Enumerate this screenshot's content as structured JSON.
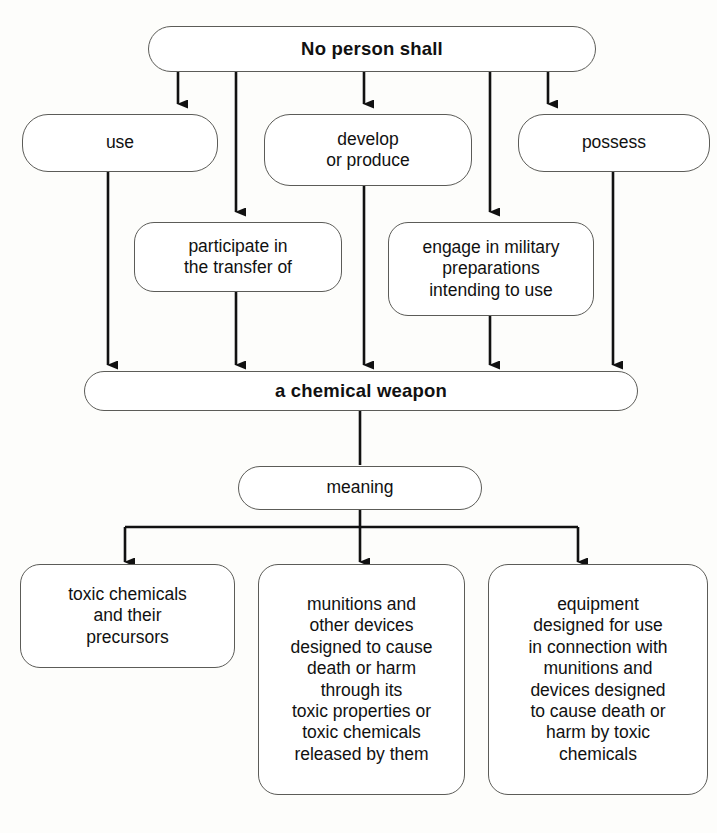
{
  "diagram": {
    "stroke_color": "#5c5c58",
    "arrow_color": "#111111",
    "background_color": "#fdfdfb",
    "text_color": "#111111"
  },
  "nodes": {
    "root": {
      "label": "No person shall"
    },
    "prohibitions": [
      {
        "id": "use",
        "label": "use"
      },
      {
        "id": "develop-or-produce",
        "label": "develop\nor produce"
      },
      {
        "id": "possess",
        "label": "possess"
      },
      {
        "id": "participate-in-transfer",
        "label": "participate in\nthe transfer of"
      },
      {
        "id": "engage-military-preparations",
        "label": "engage in military\npreparations\nintending to use"
      }
    ],
    "object": {
      "label": "a chemical weapon"
    },
    "relation": {
      "label": "meaning"
    },
    "definitions": [
      {
        "id": "toxic-chemicals",
        "label": "toxic chemicals\nand their\nprecursors"
      },
      {
        "id": "munitions-devices",
        "label": "munitions and\nother devices\ndesigned to cause\ndeath or harm\nthrough its\ntoxic properties or\ntoxic chemicals\nreleased by them"
      },
      {
        "id": "equipment",
        "label": "equipment\ndesigned for use\nin connection with\nmunitions and\ndevices designed\nto cause death or\nharm by toxic\nchemicals"
      }
    ]
  }
}
